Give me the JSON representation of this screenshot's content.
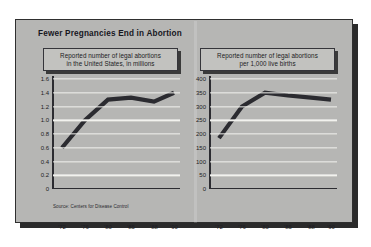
{
  "panel": {
    "title": "Fewer Pregnancies End in Abortion",
    "source": "Source: Centers for Disease Control",
    "background_color": "#b6b6b4",
    "border_color": "#2f2f2f",
    "line_color": "#2b2b30",
    "gridline_color": "#f2f2ee"
  },
  "charts": [
    {
      "caption_line1": "Reported number of legal abortions",
      "caption_line2": "in the United States, in millions"
    },
    {
      "caption_line1": "Reported number of legal abortions",
      "caption_line2": "per 1,000 live births"
    }
  ],
  "chart_data": [
    {
      "type": "line",
      "title": "Reported number of legal abortions in the United States, in millions",
      "xlabel": "",
      "ylabel": "",
      "x": [
        "'72",
        "'76",
        "'80",
        "'85",
        "'88",
        "'90"
      ],
      "values": [
        0.6,
        1.0,
        1.3,
        1.33,
        1.27,
        1.4
      ],
      "ylim": [
        0,
        1.6
      ],
      "ytick_labels": [
        "1.6",
        "1.4",
        "1.2",
        "1.0",
        "0.8",
        "0.6",
        "0.4",
        "0.2",
        "0"
      ],
      "ytick_values": [
        1.6,
        1.4,
        1.2,
        1.0,
        0.8,
        0.6,
        0.4,
        0.2,
        0
      ],
      "grid": "horizontal",
      "legend": "none",
      "line_color": "#2b2b30",
      "source": "Source: Centers for Disease Control"
    },
    {
      "type": "line",
      "title": "Reported number of legal abortions per 1,000 live births",
      "xlabel": "",
      "ylabel": "",
      "x": [
        "'72",
        "'76",
        "'80",
        "'85",
        "'88",
        "'90"
      ],
      "values": [
        185,
        300,
        350,
        340,
        332,
        325
      ],
      "ylim": [
        0,
        400
      ],
      "ytick_labels": [
        "400",
        "350",
        "300",
        "250",
        "200",
        "150",
        "100",
        "50",
        "0"
      ],
      "ytick_values": [
        400,
        350,
        300,
        250,
        200,
        150,
        100,
        50,
        0
      ],
      "grid": "horizontal",
      "legend": "none",
      "line_color": "#2b2b30",
      "source": "Source: Centers for Disease Control"
    }
  ]
}
